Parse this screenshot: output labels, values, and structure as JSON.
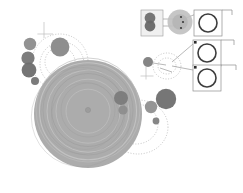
{
  "figure": {
    "title": "",
    "background": "#ffffff",
    "width": 243,
    "height": 193
  },
  "palette": {
    "disk_fill": "#a8a8a8",
    "disk_ring_light": "#c3c3c3",
    "disk_ring_dark": "#9a9a9a",
    "clump_dark": "#6e6e6e",
    "clump_mid": "#8a8a8a",
    "clump_light": "#b9b9b9",
    "dotted_orbit": "#9d9d9d",
    "inset_border": "#8e8e8e",
    "inset_ring": "#4a4a4a",
    "leader_line": "#7d7d7d",
    "crosshair": "#bdbdbd",
    "marker_square": "#2b2b2b"
  },
  "chart_data": {
    "type": "scatter",
    "title": "",
    "xlabel": "",
    "ylabel": "",
    "xlim": [
      0,
      243
    ],
    "ylim": [
      0,
      193
    ],
    "grid": false,
    "legend": null,
    "main_disk": {
      "name": "primary-disk",
      "cx": 88,
      "cy": 114,
      "r": 54,
      "fill": "#a8a8a8",
      "core": {
        "cx": 88,
        "cy": 110,
        "r": 2.6,
        "fill": "#9c9c9c"
      },
      "rings": [
        {
          "r": 52.0,
          "stroke": "#bdbdbd",
          "width": 0.8
        },
        {
          "r": 48.5,
          "stroke": "#c6c6c6",
          "width": 1.1
        },
        {
          "r": 45.0,
          "stroke": "#9e9e9e",
          "width": 0.7
        },
        {
          "r": 41.0,
          "stroke": "#c2c2c2",
          "width": 1.0
        },
        {
          "r": 36.5,
          "stroke": "#9b9b9b",
          "width": 0.7
        },
        {
          "r": 32.0,
          "stroke": "#c0c0c0",
          "width": 0.9
        },
        {
          "r": 27.0,
          "stroke": "#a0a0a0",
          "width": 0.6
        },
        {
          "r": 22.0,
          "stroke": "#bebebe",
          "width": 0.9
        }
      ]
    },
    "clumps": [
      {
        "id": "c1",
        "cx": 30,
        "cy": 44,
        "r": 6.2,
        "fill": "#8c8c8c",
        "label": "upper-left-clump-a"
      },
      {
        "id": "c2",
        "cx": 28,
        "cy": 58,
        "r": 6.6,
        "fill": "#767676",
        "label": "upper-left-clump-b"
      },
      {
        "id": "c3",
        "cx": 29,
        "cy": 70,
        "r": 7.4,
        "fill": "#6e6e6e",
        "label": "upper-left-clump-c"
      },
      {
        "id": "c4",
        "cx": 35,
        "cy": 81,
        "r": 4.0,
        "fill": "#747474",
        "label": "upper-left-clump-d"
      },
      {
        "id": "c5",
        "cx": 60,
        "cy": 47,
        "r": 9.4,
        "fill": "#888888",
        "label": "upper-clump-large"
      },
      {
        "id": "c6",
        "cx": 121,
        "cy": 98,
        "r": 7.0,
        "fill": "#7b7b7b",
        "label": "inner-right-clump"
      },
      {
        "id": "c7",
        "cx": 123,
        "cy": 110,
        "r": 4.6,
        "fill": "#8d8d8d",
        "label": "inner-right-clump-small"
      },
      {
        "id": "c8",
        "cx": 151,
        "cy": 107,
        "r": 6.2,
        "fill": "#8f8f8f",
        "label": "mid-right-clump"
      },
      {
        "id": "c9",
        "cx": 166,
        "cy": 99,
        "r": 10.2,
        "fill": "#6f6f6f",
        "label": "outer-right-clump-large"
      },
      {
        "id": "c10",
        "cx": 156,
        "cy": 121,
        "r": 3.4,
        "fill": "#808080",
        "label": "lower-right-clump-small"
      },
      {
        "id": "c11",
        "cx": 148,
        "cy": 62,
        "r": 5.0,
        "fill": "#7e7e7e",
        "label": "inset-source-clump"
      }
    ],
    "dotted_orbits": [
      {
        "cx": 60,
        "cy": 62,
        "rx": 28,
        "ry": 28,
        "label": "orbit-upper-left-outer"
      },
      {
        "cx": 62,
        "cy": 64,
        "rx": 22,
        "ry": 22,
        "label": "orbit-upper-left-inner"
      },
      {
        "cx": 60,
        "cy": 62,
        "rx": 15,
        "ry": 15,
        "label": "orbit-upper-left-core"
      },
      {
        "cx": 138,
        "cy": 127,
        "rx": 30,
        "ry": 27,
        "label": "orbit-lower-right-outer"
      },
      {
        "cx": 136,
        "cy": 124,
        "rx": 22,
        "ry": 20,
        "label": "orbit-lower-right-inner"
      },
      {
        "cx": 167,
        "cy": 66,
        "rx": 14,
        "ry": 13,
        "label": "orbit-inset-zoom-region"
      },
      {
        "cx": 167,
        "cy": 66,
        "rx": 9,
        "ry": 8,
        "label": "orbit-inset-zoom-inner"
      }
    ],
    "crosshairs": [
      {
        "x": 44,
        "y": 34,
        "len": 12,
        "label": "axis-marker-upper-left"
      },
      {
        "x": 146,
        "y": 76,
        "len": 10,
        "label": "axis-marker-mid-right"
      }
    ],
    "insets": [
      {
        "id": "inset-a",
        "label": "zoom-inset-binary-pair",
        "x": 141,
        "y": 10,
        "w": 22,
        "h": 26,
        "border": "#9a9a9a",
        "content": "binary-clump-pair",
        "bodies": [
          {
            "cx": 150,
            "cy": 18,
            "r": 5.4,
            "fill": "#6f6f6f"
          },
          {
            "cx": 150,
            "cy": 26,
            "r": 5.4,
            "fill": "#686868"
          }
        ]
      },
      {
        "id": "inset-b",
        "label": "zoom-inset-disk-closeup",
        "x": 167,
        "y": 8,
        "w": 26,
        "h": 30,
        "border": "none",
        "content": "blurred-disk-with-point-sources",
        "disk": {
          "cx": 180,
          "cy": 22,
          "r": 12.5,
          "fill": "#c0c0c0"
        },
        "points": [
          {
            "cx": 181,
            "cy": 17,
            "r": 1.1,
            "fill": "#3a3a3a"
          },
          {
            "cx": 183,
            "cy": 22,
            "r": 1.1,
            "fill": "#3a3a3a"
          },
          {
            "cx": 181,
            "cy": 28,
            "r": 1.1,
            "fill": "#3a3a3a"
          }
        ]
      },
      {
        "id": "inset-box-1",
        "label": "detail-box-top",
        "x": 194,
        "y": 10,
        "w": 28,
        "h": 26,
        "ring": {
          "cx": 208,
          "cy": 23,
          "r": 9.0,
          "stroke": "#3d3d3d",
          "width": 1.6
        },
        "corner_marker": null,
        "rule_right": true
      },
      {
        "id": "inset-box-2",
        "label": "detail-box-middle",
        "x": 193,
        "y": 40,
        "w": 28,
        "h": 26,
        "ring": {
          "cx": 207,
          "cy": 53,
          "r": 9.0,
          "stroke": "#3d3d3d",
          "width": 1.6
        },
        "corner_marker": {
          "x": 194,
          "y": 41,
          "size": 2.6,
          "fill": "#2b2b2b"
        },
        "rule_right": true
      },
      {
        "id": "inset-box-3",
        "label": "detail-box-bottom",
        "x": 193,
        "y": 65,
        "w": 28,
        "h": 26,
        "ring": {
          "cx": 207,
          "cy": 78,
          "r": 9.0,
          "stroke": "#3d3d3d",
          "width": 1.6
        },
        "corner_marker": {
          "x": 194,
          "y": 66,
          "size": 2.6,
          "fill": "#2b2b2b"
        },
        "rule_right": true
      }
    ],
    "leader_lines": [
      {
        "from": [
          156,
          19
        ],
        "to": [
          176,
          19
        ],
        "label": "leader-inset-a-to-b-upper"
      },
      {
        "from": [
          156,
          26
        ],
        "to": [
          176,
          26
        ],
        "label": "leader-inset-a-to-b-lower"
      },
      {
        "from": [
          186,
          18
        ],
        "to": [
          196,
          14
        ],
        "label": "leader-inset-b-to-box1"
      },
      {
        "from": [
          172,
          62
        ],
        "to": [
          193,
          44
        ],
        "label": "leader-zoom-to-box2"
      },
      {
        "from": [
          172,
          66
        ],
        "to": [
          193,
          70
        ],
        "label": "leader-zoom-to-box3"
      },
      {
        "from": [
          153,
          63
        ],
        "to": [
          166,
          65
        ],
        "label": "leader-clump-to-zoom"
      },
      {
        "from": [
          160,
          68
        ],
        "to": [
          172,
          72
        ],
        "label": "leader-zoom-detail"
      }
    ],
    "scale_rules": [
      {
        "x1": 222,
        "y1": 10,
        "x2": 232,
        "y2": 10,
        "label": "rule-box1"
      },
      {
        "x1": 221,
        "y1": 40,
        "x2": 234,
        "y2": 40,
        "label": "rule-box2"
      },
      {
        "x1": 221,
        "y1": 65,
        "x2": 236,
        "y2": 65,
        "label": "rule-box3"
      }
    ]
  }
}
